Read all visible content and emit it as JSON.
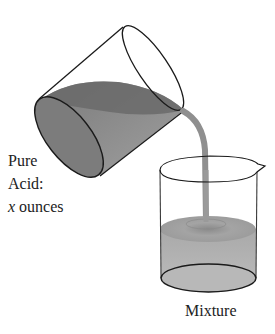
{
  "figure": {
    "type": "illustration",
    "colors": {
      "outline": "#1a1a1a",
      "acid_dark": "#6e6e6e",
      "acid_mid": "#8c8c8c",
      "acid_light": "#a6a6a6",
      "mixture": "#b4b4b4",
      "mixture_surface": "#9e9e9e",
      "stream": "#8f8f8f",
      "background": "#ffffff"
    }
  },
  "labels": {
    "source_line1": "Pure",
    "source_line2": "Acid:",
    "source_var": "x",
    "source_unit": " ounces",
    "target": "Mixture"
  }
}
